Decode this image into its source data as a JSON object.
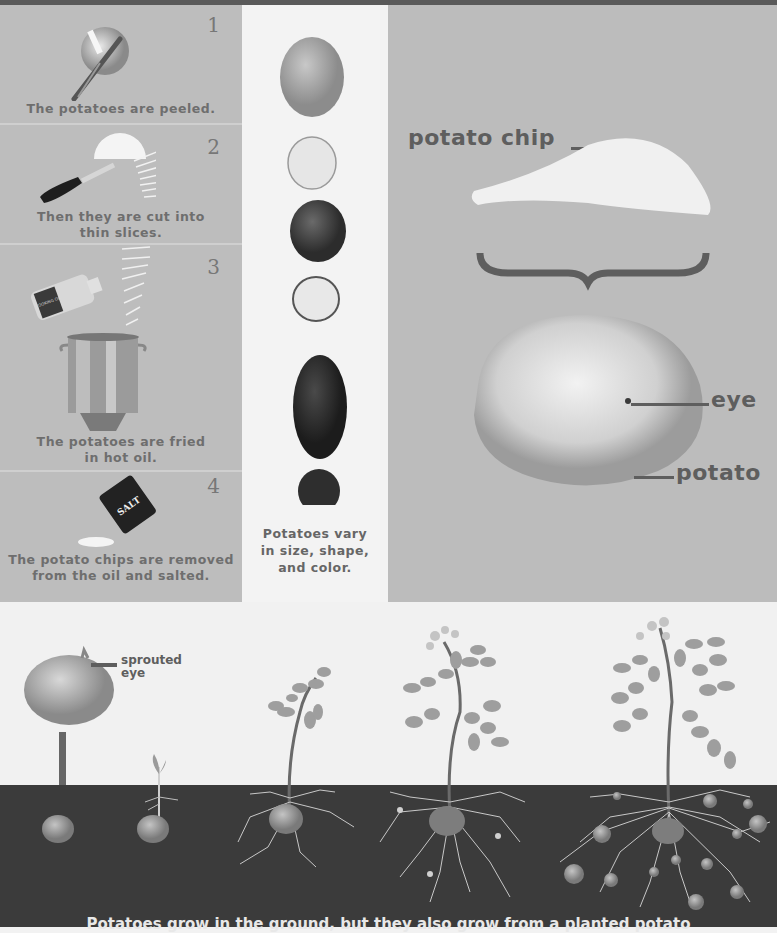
{
  "steps": [
    {
      "number": "1",
      "caption": "The potatoes are peeled.",
      "image": "peeler-and-potato"
    },
    {
      "number": "2",
      "caption_line1": "Then they are cut into",
      "caption_line2": "thin slices.",
      "image": "knife-slicing-potato"
    },
    {
      "number": "3",
      "caption_line1": "The potatoes are fried",
      "caption_line2": "in hot oil.",
      "image": "oil-bottle-and-pot"
    },
    {
      "number": "4",
      "caption_line1": "The potato chips are removed",
      "caption_line2": "from the oil and salted.",
      "image": "salt-shaker-and-chip"
    }
  ],
  "labels": {
    "oil_bottle": "COOKING OIL",
    "salt": "SALT"
  },
  "varieties": {
    "caption_line1": "Potatoes vary",
    "caption_line2": "in size, shape,",
    "caption_line3": "and color.",
    "items": [
      "whole-light",
      "cut-light",
      "whole-dark",
      "cut-red",
      "whole-long-dark",
      "cut-purple"
    ]
  },
  "comparison": {
    "chip_label": "potato chip",
    "eye_label": "eye",
    "potato_label": "potato"
  },
  "growth": {
    "sprouted_label_line1": "sprouted",
    "sprouted_label_line2": "eye",
    "stages": [
      "planted-potato",
      "sprout",
      "young-plant",
      "flowering-plant",
      "mature-plant-with-tubers"
    ],
    "caption_partial": "Potatoes grow in the ground, but they also grow from a planted potato"
  },
  "colors": {
    "panel_gray": "#bdbdbd",
    "label_dark": "#5e5e5e",
    "soil": "#3b3b3b"
  }
}
